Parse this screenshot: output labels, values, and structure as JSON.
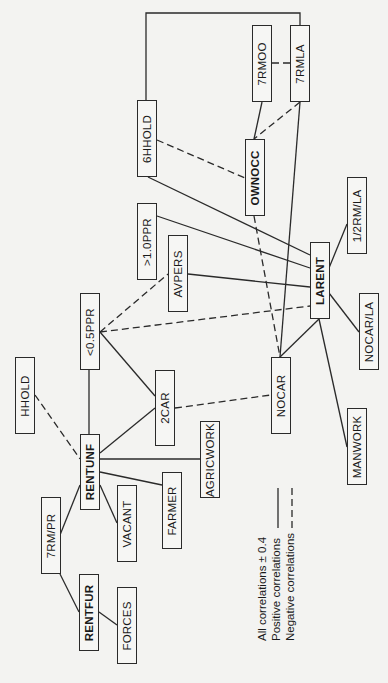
{
  "diagram": {
    "nodes": [
      {
        "id": "7RMOO",
        "label": "7RMOO",
        "bold": false,
        "x": 252,
        "y": 25,
        "w": 20,
        "h": 77
      },
      {
        "id": "7RMLA",
        "label": "7RMLA",
        "bold": false,
        "x": 290,
        "y": 25,
        "w": 20,
        "h": 77
      },
      {
        "id": "6HHOLD",
        "label": "6HHOLD",
        "bold": false,
        "x": 137,
        "y": 100,
        "w": 20,
        "h": 77
      },
      {
        "id": "OWNOCC",
        "label": "OWNOCC",
        "bold": true,
        "x": 245,
        "y": 139,
        "w": 20,
        "h": 77
      },
      {
        "id": "1/2RM/LA",
        "label": "1/2RM/LA",
        "bold": false,
        "x": 347,
        "y": 177,
        "w": 20,
        "h": 77
      },
      {
        "id": ">1.0PPR",
        "label": ">1.0PPR",
        "bold": false,
        "x": 137,
        "y": 203,
        "w": 20,
        "h": 77
      },
      {
        "id": "AVPERS",
        "label": "AVPERS",
        "bold": false,
        "x": 168,
        "y": 235,
        "w": 20,
        "h": 77
      },
      {
        "id": "LARENT",
        "label": "LARENT",
        "bold": true,
        "x": 310,
        "y": 242,
        "w": 20,
        "h": 77
      },
      {
        "id": "NOCAR/LA",
        "label": "NOCAR/LA",
        "bold": false,
        "x": 359,
        "y": 293,
        "w": 20,
        "h": 77
      },
      {
        "id": "<0.5PPR",
        "label": "<0.5PPR",
        "bold": false,
        "x": 80,
        "y": 293,
        "w": 20,
        "h": 77
      },
      {
        "id": "HHOLD",
        "label": "HHOLD",
        "bold": false,
        "x": 15,
        "y": 357,
        "w": 20,
        "h": 77
      },
      {
        "id": "NOCAR",
        "label": "NOCAR",
        "bold": false,
        "x": 271,
        "y": 357,
        "w": 20,
        "h": 77
      },
      {
        "id": "2CAR",
        "label": "2CAR",
        "bold": false,
        "x": 155,
        "y": 370,
        "w": 20,
        "h": 76
      },
      {
        "id": "MANWORK",
        "label": "MANWORK",
        "bold": false,
        "x": 347,
        "y": 408,
        "w": 20,
        "h": 77
      },
      {
        "id": "AGRICWORK",
        "label": "AGRICWORK",
        "bold": false,
        "x": 200,
        "y": 421,
        "w": 20,
        "h": 77
      },
      {
        "id": "RENTUNF",
        "label": "RENTUNF",
        "bold": true,
        "x": 80,
        "y": 434,
        "w": 20,
        "h": 76
      },
      {
        "id": "FARMER",
        "label": "FARMER",
        "bold": false,
        "x": 162,
        "y": 472,
        "w": 20,
        "h": 77
      },
      {
        "id": "VACANT",
        "label": "VACANT",
        "bold": false,
        "x": 117,
        "y": 485,
        "w": 20,
        "h": 77
      },
      {
        "id": "7RM/PR",
        "label": "7RM/PR",
        "bold": false,
        "x": 41,
        "y": 497,
        "w": 20,
        "h": 77
      },
      {
        "id": "RENTFUR",
        "label": "RENTFUR",
        "bold": true,
        "x": 79,
        "y": 574,
        "w": 20,
        "h": 77
      },
      {
        "id": "FORCES",
        "label": "FORCES",
        "bold": false,
        "x": 117,
        "y": 587,
        "w": 20,
        "h": 77
      }
    ],
    "edges": [
      {
        "from": "6HHOLD",
        "to": "7RMLA",
        "type": "positive",
        "path": "M146,100 L146,13 L300,13 L300,25"
      },
      {
        "from": "7RMOO",
        "to": "7RMLA",
        "type": "negative",
        "path": "M272,63 L290,63"
      },
      {
        "from": "7RMOO",
        "to": "OWNOCC",
        "type": "positive",
        "path": "M262,102 L254,139"
      },
      {
        "from": "7RMLA",
        "to": "OWNOCC",
        "type": "negative",
        "path": "M300,102 L254,139"
      },
      {
        "from": "7RMLA",
        "to": "NOCAR",
        "type": "positive",
        "path": "M300,102 L280,357"
      },
      {
        "from": "6HHOLD",
        "to": "OWNOCC",
        "type": "negative",
        "path": "M157,140 L245,178"
      },
      {
        "from": "6HHOLD",
        "to": "LARENT",
        "type": "positive",
        "path": "M148,177 L310,255"
      },
      {
        "from": "OWNOCC",
        "to": "NOCAR",
        "type": "negative",
        "path": "M254,216 L280,357"
      },
      {
        "from": ">1.0PPR",
        "to": "LARENT",
        "type": "positive",
        "path": "M157,216 L310,268"
      },
      {
        "from": "AVPERS",
        "to": "LARENT",
        "type": "positive",
        "path": "M188,274 L310,287"
      },
      {
        "from": "<0.5PPR",
        "to": "LARENT",
        "type": "negative",
        "path": "M100,332 L310,306"
      },
      {
        "from": "<0.5PPR",
        "to": "AVPERS",
        "type": "negative",
        "path": "M100,332 L168,274"
      },
      {
        "from": "1/2RM/LA",
        "to": "LARENT",
        "type": "positive",
        "path": "M347,224 L329,268"
      },
      {
        "from": "LARENT",
        "to": "NOCAR/LA",
        "type": "positive",
        "path": "M329,293 L359,332"
      },
      {
        "from": "LARENT",
        "to": "NOCAR",
        "type": "positive",
        "path": "M319,319 L280,357"
      },
      {
        "from": "LARENT",
        "to": "MANWORK",
        "type": "positive",
        "path": "M319,319 L347,447"
      },
      {
        "from": "<0.5PPR",
        "to": "2CAR",
        "type": "positive",
        "path": "M100,332 L155,396"
      },
      {
        "from": "<0.5PPR",
        "to": "RENTUNF",
        "type": "positive",
        "path": "M89,370 L89,434"
      },
      {
        "from": "2CAR",
        "to": "NOCAR",
        "type": "negative",
        "path": "M175,408 L271,395"
      },
      {
        "from": "HHOLD",
        "to": "RENTUNF",
        "type": "negative",
        "path": "M35,395 L80,459"
      },
      {
        "from": "RENTUNF",
        "to": "2CAR",
        "type": "positive",
        "path": "M100,453 L155,408"
      },
      {
        "from": "RENTUNF",
        "to": "AGRICWORK",
        "type": "positive",
        "path": "M100,459 L200,459"
      },
      {
        "from": "RENTUNF",
        "to": "FARMER",
        "type": "positive",
        "path": "M100,472 L162,485"
      },
      {
        "from": "RENTUNF",
        "to": "VACANT",
        "type": "positive",
        "path": "M100,485 L117,523"
      },
      {
        "from": "RENTUNF",
        "to": "7RM/PR",
        "type": "positive",
        "path": "M80,485 L60,535"
      },
      {
        "from": "7RM/PR",
        "to": "RENTFUR",
        "type": "positive",
        "path": "M60,574 L79,612"
      },
      {
        "from": "RENTFUR",
        "to": "FORCES",
        "type": "positive",
        "path": "M99,612 L117,625"
      }
    ]
  },
  "legend": {
    "title": "All  correlations  ±  0.4",
    "positive_label": "Positive  correlations",
    "negative_label": "Negative  correlations",
    "positive_style": "solid",
    "negative_style": "dashed"
  },
  "colors": {
    "line": "#2a2a2a",
    "background": "#f3f3f1"
  }
}
